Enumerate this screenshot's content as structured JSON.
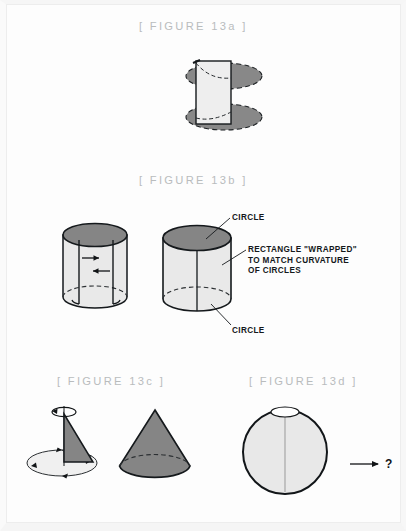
{
  "page": {
    "background_color": "#fdfdfd",
    "frame_color": "#f5f5f5"
  },
  "palette": {
    "title_gray": "#b9bcbd",
    "ink": "#14181a",
    "dark_fill": "#808080",
    "mid_fill": "#909090",
    "light_fill": "#e8e8e8",
    "pale_fill": "#efefef",
    "outline": "#121619"
  },
  "figures": [
    {
      "id": "13a",
      "title": "[ FIGURE 13a ]",
      "title_x": 139,
      "title_y": 20,
      "shape": "two-dashed-ellipses-with-rectangle",
      "description": "Two dark gray dashed-edge ellipses separated vertically with a light vertical rectangle between them"
    },
    {
      "id": "13b",
      "title": "[ FIGURE 13b ]",
      "title_x": 139,
      "title_y": 174,
      "shape": "two-cylinders",
      "description": "Left cylinder with wrapping arrows, right finished cylinder with callout labels"
    },
    {
      "id": "13c",
      "title": "[ FIGURE 13c ]",
      "title_x": 57,
      "title_y": 375,
      "shape": "rotating-triangle-and-cone",
      "description": "Triangle sweeping around a vertical axis forming a cone, plus completed cone"
    },
    {
      "id": "13d",
      "title": "[ FIGURE 13d ]",
      "title_x": 249,
      "title_y": 375,
      "shape": "rotating-circle-with-question",
      "description": "Circle rotating about a vertical axis with arrow leading to a question mark"
    }
  ],
  "callouts": [
    {
      "text": "CIRCLE",
      "x": 232,
      "y": 213,
      "for": "13b-top-circle"
    },
    {
      "text": "RECTANGLE \"WRAPPED\"\nTO MATCH CURVATURE\nOF CIRCLES",
      "x": 248,
      "y": 245,
      "for": "13b-rectangle"
    },
    {
      "text": "CIRCLE",
      "x": 232,
      "y": 326,
      "for": "13b-bottom-circle"
    }
  ],
  "question_mark": {
    "text": "?",
    "x": 385,
    "y": 464
  }
}
